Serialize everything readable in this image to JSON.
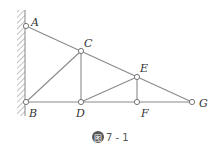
{
  "figure": {
    "caption_badge": "图",
    "caption_number": "7 - 1",
    "colors": {
      "line": "#888888",
      "label": "#333333",
      "badge": "#555555",
      "hatch": "#999999"
    }
  },
  "nodes": {
    "A": {
      "label": "A",
      "x": 26,
      "y": 26
    },
    "B": {
      "label": "B",
      "x": 26,
      "y": 102
    },
    "C": {
      "label": "C",
      "x": 81,
      "y": 51
    },
    "D": {
      "label": "D",
      "x": 81,
      "y": 102
    },
    "E": {
      "label": "E",
      "x": 137,
      "y": 77
    },
    "F": {
      "label": "F",
      "x": 137,
      "y": 102
    },
    "G": {
      "label": "G",
      "x": 192,
      "y": 102
    }
  },
  "members": [
    [
      "A",
      "G"
    ],
    [
      "B",
      "G"
    ],
    [
      "A",
      "B"
    ],
    [
      "B",
      "C"
    ],
    [
      "C",
      "D"
    ],
    [
      "D",
      "E"
    ],
    [
      "E",
      "F"
    ]
  ]
}
